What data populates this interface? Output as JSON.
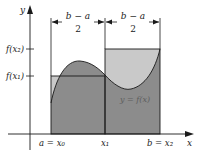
{
  "diagram": {
    "axes": {
      "x_label": "x",
      "y_label": "y"
    },
    "dimension_labels": {
      "left": {
        "numerator": "b − a",
        "denominator": "2"
      },
      "right": {
        "numerator": "b − a",
        "denominator": "2"
      }
    },
    "y_ticks": [
      {
        "label": "f(x₂)"
      },
      {
        "label": "f(x₁)"
      }
    ],
    "x_ticks": [
      {
        "label": "a = x₀"
      },
      {
        "label": "x₁"
      },
      {
        "label": "b = x₂"
      }
    ],
    "curve_label": "y = f(x)",
    "colors": {
      "dark_fill": "#8c8c8c",
      "light_fill": "#c9c9c9",
      "outline": "#1a1a1a"
    }
  }
}
